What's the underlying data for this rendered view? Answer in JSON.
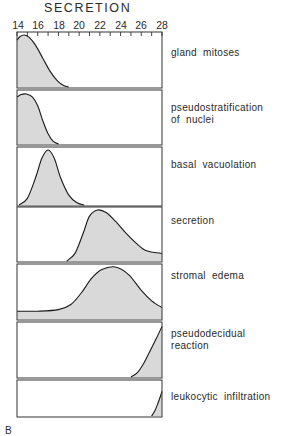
{
  "chart_data": {
    "type": "area",
    "title": "SECRETION",
    "xlabel": "",
    "ylabel": "",
    "xlim": [
      14,
      28
    ],
    "x_ticks": [
      14,
      16,
      18,
      20,
      22,
      24,
      26,
      28
    ],
    "minor_ticks_every": 1,
    "grid": false,
    "legend": "none (row labels at right of each panel)",
    "panel_label": "B",
    "fill_color": "#d9d9d9",
    "line_color": "#1a1a1a",
    "series": [
      {
        "name": "gland mitoses",
        "x": [
          14,
          14.3,
          14.7,
          15.2,
          15.8,
          16.5,
          17.2,
          17.9,
          18.5,
          19.0
        ],
        "values": [
          0.9,
          0.97,
          1.0,
          0.95,
          0.8,
          0.55,
          0.3,
          0.12,
          0.03,
          0.0
        ]
      },
      {
        "name": "pseudostratification of nuclei",
        "x": [
          14,
          14.4,
          14.9,
          15.5,
          16.0,
          16.5,
          17.0,
          17.5,
          18.0
        ],
        "values": [
          0.92,
          0.97,
          0.98,
          0.92,
          0.75,
          0.45,
          0.2,
          0.05,
          0.0
        ]
      },
      {
        "name": "basal vacuolation",
        "x": [
          14.2,
          15.0,
          15.8,
          16.4,
          17.0,
          17.6,
          18.2,
          19.0,
          19.8,
          20.5
        ],
        "values": [
          0.0,
          0.12,
          0.5,
          0.85,
          1.0,
          0.85,
          0.5,
          0.18,
          0.04,
          0.0
        ]
      },
      {
        "name": "secretion",
        "x": [
          18.8,
          19.6,
          20.4,
          21.0,
          21.8,
          22.6,
          23.5,
          24.5,
          25.5,
          26.5,
          28.0
        ],
        "values": [
          0.0,
          0.15,
          0.55,
          0.88,
          1.0,
          0.95,
          0.78,
          0.55,
          0.35,
          0.2,
          0.15
        ]
      },
      {
        "name": "stromal edema",
        "x": [
          14.0,
          16.0,
          18.0,
          19.2,
          20.2,
          21.2,
          22.2,
          23.5,
          24.8,
          26.0,
          27.0,
          28.0
        ],
        "values": [
          0.15,
          0.15,
          0.18,
          0.28,
          0.5,
          0.78,
          0.95,
          1.0,
          0.85,
          0.55,
          0.35,
          0.22
        ]
      },
      {
        "name": "pseudodecidual reaction",
        "x": [
          25.0,
          25.6,
          26.2,
          26.8,
          27.4,
          28.0
        ],
        "values": [
          0.0,
          0.08,
          0.25,
          0.48,
          0.72,
          0.97
        ]
      },
      {
        "name": "leukocytic infiltration",
        "x": [
          27.0,
          27.3,
          27.6,
          27.85,
          28.0
        ],
        "values": [
          0.0,
          0.15,
          0.38,
          0.6,
          0.75
        ]
      }
    ]
  },
  "labels": {
    "title": "SECRETION",
    "ticks": [
      "14",
      "16",
      "18",
      "20",
      "22",
      "24",
      "26",
      "28"
    ],
    "rows": [
      {
        "line1": "gland mitoses",
        "line2": ""
      },
      {
        "line1": "pseudostratification",
        "line2": "of nuclei"
      },
      {
        "line1": "basal vacuolation",
        "line2": ""
      },
      {
        "line1": "secretion",
        "line2": ""
      },
      {
        "line1": "stromal edema",
        "line2": ""
      },
      {
        "line1": "pseudodecidual",
        "line2": "reaction"
      },
      {
        "line1": "leukocytic infiltration",
        "line2": ""
      }
    ],
    "panel_letter": "B"
  }
}
